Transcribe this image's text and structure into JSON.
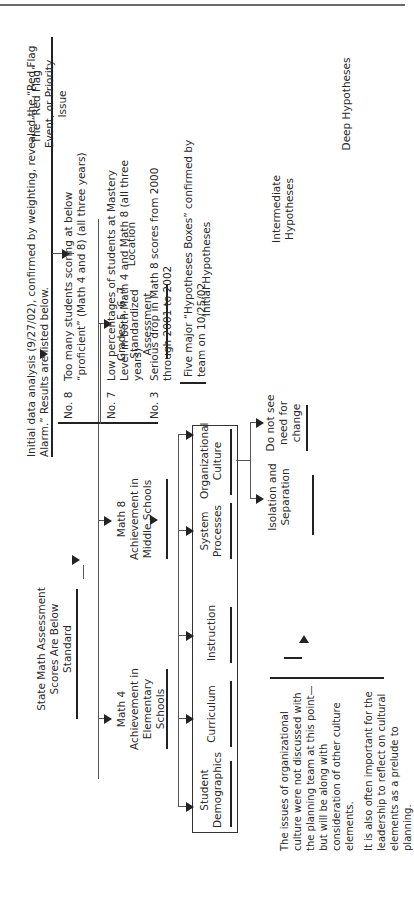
{
  "levels": {
    "red_flag": "The “Red Flag” Event, or Priority Issue",
    "location": "Location",
    "initial": "Initial Hypotheses",
    "intermediate": "Intermediate Hypotheses",
    "deep": "Deep Hypotheses"
  },
  "root": "State Math Assessment Scores Are Below Standard",
  "analysis_note": "Initial data analysis (9/27/02), confirmed by weighting, revealed the “Red Flag Alarm.” Results are listed below.",
  "locations": [
    "Math 4 Achievement in Elementary Schools",
    "Math 8 Achievement in Middle Schools",
    "Grades 5, 6, 7 Standardized Assessment"
  ],
  "ranked_results": [
    {
      "rank": "No. 8",
      "text": "Too many students scoring at below “proficient” (Math 4 and 8) (all three years)"
    },
    {
      "rank": "No. 7",
      "text": "Low percentages of students at Mastery Level in both Math 4 and Math 8 (all three years)"
    },
    {
      "rank": "No. 3",
      "text": "Serious drop in Math 8 scores from 2000 through 2001 to 2002"
    }
  ],
  "hypotheses_note": "Five major “Hypotheses Boxes” confirmed by team on 10/25/02",
  "initial_hypotheses": [
    "Student Demographics",
    "Curriculum",
    "Instruction",
    "System Processes",
    "Organizational Culture"
  ],
  "intermediate_hypotheses": [
    "Isolation and Separation",
    "Do not see need for change"
  ],
  "footnote": {
    "p1": "The issues of organizational culture were not discussed with the planning team at this point—but will be along with consideration of other culture elements.",
    "p2": "It is also often important for the leadership to reflect on cultural elements as a prelude to planning."
  }
}
